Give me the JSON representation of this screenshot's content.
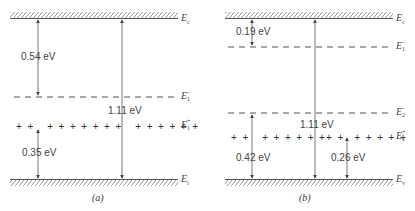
{
  "panels": [
    {
      "id": "a",
      "caption": "(a)",
      "levels": {
        "conduction": {
          "symbol": "E",
          "sub": "c"
        },
        "acceptor_minus": {
          "symbol": "E",
          "sub": "1",
          "sup": "−"
        },
        "donor_plus": {
          "symbol": "E",
          "sub": "1",
          "sup": "+"
        },
        "valence": {
          "symbol": "E",
          "sub": "i"
        }
      },
      "energies": {
        "gap": "1.11 eV",
        "ec_to_e1minus": "0.54 eV",
        "ev_to_e1plus": "0.35 eV"
      },
      "plus_row": "+ +   + + + + + + + +   + + + + + +"
    },
    {
      "id": "b",
      "caption": "(b)",
      "levels": {
        "conduction": {
          "symbol": "E",
          "sub": "c"
        },
        "acceptor1_minus": {
          "symbol": "E",
          "sub": "1",
          "sup": "−"
        },
        "acceptor2_minus": {
          "symbol": "E",
          "sub": "2",
          "sup": "−"
        },
        "donor_plus": {
          "symbol": "E",
          "sub": "1",
          "sup": "+"
        },
        "valence": {
          "symbol": "E",
          "sub": "v"
        }
      },
      "energies": {
        "gap": "1.11 eV",
        "ec_to_e1minus": "0.19 eV",
        "ev_to_e2minus": "0.42 eV",
        "ev_to_e1plus": "0.26 eV"
      },
      "plus_row_left": "+ +   + + + + + +",
      "plus_row_right": "+ +   + + + + +"
    }
  ]
}
